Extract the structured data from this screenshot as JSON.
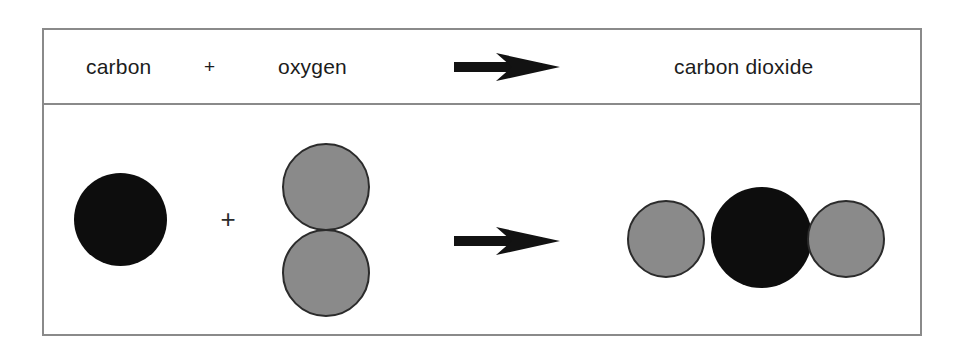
{
  "diagram": {
    "word_row": {
      "reactant_1": "carbon",
      "plus": "+",
      "reactant_2": "oxygen",
      "arrow": "reaction-arrow",
      "product": "carbon dioxide"
    },
    "model_row": {
      "plus": "+",
      "arrow": "reaction-arrow"
    },
    "colors": {
      "carbon_atom": "#0d0d0d",
      "oxygen_atom": "#8a8a8a",
      "atom_outline": "#2b2b2b",
      "frame": "#8a8a8a",
      "text": "#1c1c1c",
      "background": "#ffffff"
    },
    "atoms": [
      {
        "label": "carbon-atom-reactant",
        "element": "carbon",
        "color": "#0d0d0d",
        "diameter": 93
      },
      {
        "label": "oxygen-atom-reactant-top",
        "element": "oxygen",
        "color": "#8a8a8a",
        "diameter": 88
      },
      {
        "label": "oxygen-atom-reactant-bottom",
        "element": "oxygen",
        "color": "#8a8a8a",
        "diameter": 88
      },
      {
        "label": "oxygen-atom-product-left",
        "element": "oxygen",
        "color": "#8a8a8a",
        "diameter": 78
      },
      {
        "label": "carbon-atom-product",
        "element": "carbon",
        "color": "#0d0d0d",
        "diameter": 101
      },
      {
        "label": "oxygen-atom-product-right",
        "element": "oxygen",
        "color": "#8a8a8a",
        "diameter": 78
      }
    ]
  }
}
